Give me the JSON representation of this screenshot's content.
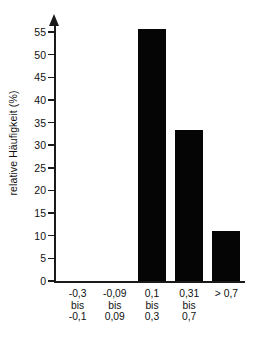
{
  "chart_data": {
    "type": "bar",
    "title": "",
    "subtitle": "",
    "xlabel": "",
    "ylabel": "relative Häufigkeit (%)",
    "categories": [
      "-0,3 bis -0,1",
      "-0,09 bis 0,09",
      "0,1 bis 0,3",
      "0,31 bis 0,7",
      "> 0,7"
    ],
    "category_lines": [
      [
        "-0,3",
        "bis",
        "-0,1"
      ],
      [
        "-0,09",
        "bis",
        "0,09"
      ],
      [
        "0,1",
        "bis",
        "0,3"
      ],
      [
        "0,31",
        "bis",
        "0,7"
      ],
      [
        "> 0,7"
      ]
    ],
    "values": [
      0,
      0,
      55.6,
      33.3,
      11.1
    ],
    "ylim": [
      0,
      57
    ],
    "yticks": [
      0,
      5,
      10,
      15,
      20,
      25,
      30,
      35,
      40,
      45,
      50,
      55
    ],
    "ytick_labels": [
      "0",
      "5",
      "10",
      "15",
      "20",
      "25",
      "30",
      "35",
      "40",
      "45",
      "50",
      "55"
    ],
    "grid": false,
    "legend": null,
    "bar_color": "#050505",
    "axis_color": "#1a1a1a",
    "background_color": "#ffffff"
  }
}
